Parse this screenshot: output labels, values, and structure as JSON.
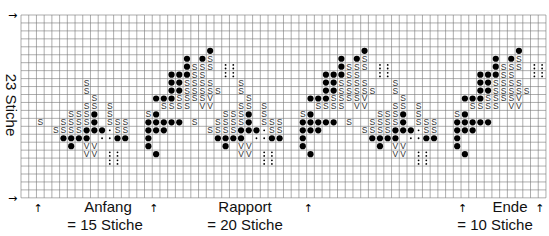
{
  "chart_data": {
    "type": "knitting-chart-grid",
    "rows": 23,
    "cols": 68,
    "repeat_width": 20,
    "y_label": "23 Stiche",
    "sections": [
      {
        "name": "Anfang",
        "label": "= 15 Stiche",
        "stitches": 15
      },
      {
        "name": "Rapport",
        "label": "= 20 Stiche",
        "stitches": 20
      },
      {
        "name": "Ende",
        "label": "= 10 Stiche",
        "stitches": 10
      }
    ],
    "symbols": {
      "dot": "●",
      "S": "S",
      "V": "V",
      "colon": ":"
    },
    "low_motif_anchors": [
      8,
      28,
      48
    ],
    "high_motif_anchors": [
      24,
      44,
      64
    ],
    "low_motif": [
      [
        8,
        0,
        "S"
      ],
      [
        9,
        0,
        "S"
      ],
      [
        10,
        1,
        "S"
      ],
      [
        11,
        0,
        "S"
      ],
      [
        11,
        1,
        "S"
      ],
      [
        11,
        3,
        "S"
      ],
      [
        12,
        -2,
        "S"
      ],
      [
        12,
        -1,
        "S"
      ],
      [
        12,
        0,
        "S"
      ],
      [
        12,
        1,
        "dot"
      ],
      [
        12,
        3,
        "S"
      ],
      [
        13,
        -6,
        "S"
      ],
      [
        13,
        -3,
        "S"
      ],
      [
        13,
        -2,
        "S"
      ],
      [
        13,
        -1,
        "S"
      ],
      [
        13,
        0,
        "S"
      ],
      [
        13,
        1,
        "dot"
      ],
      [
        13,
        3,
        "S"
      ],
      [
        13,
        4,
        "S"
      ],
      [
        13,
        5,
        "S"
      ],
      [
        14,
        -4,
        "S"
      ],
      [
        14,
        -3,
        "S"
      ],
      [
        14,
        -2,
        "S"
      ],
      [
        14,
        -1,
        "S"
      ],
      [
        14,
        0,
        "dot"
      ],
      [
        14,
        1,
        "dot"
      ],
      [
        14,
        2,
        "dot"
      ],
      [
        14,
        3,
        "sdot"
      ],
      [
        14,
        4,
        "S"
      ],
      [
        14,
        5,
        "S"
      ],
      [
        15,
        -3,
        "dot"
      ],
      [
        15,
        -2,
        "dot"
      ],
      [
        15,
        -1,
        "dot"
      ],
      [
        15,
        0,
        "dot"
      ],
      [
        15,
        2,
        "sdot"
      ],
      [
        15,
        3,
        "sdot"
      ],
      [
        15,
        4,
        "dot"
      ],
      [
        15,
        5,
        "dot"
      ],
      [
        16,
        -2,
        "dot"
      ],
      [
        16,
        0,
        "V"
      ],
      [
        16,
        1,
        "V"
      ],
      [
        17,
        0,
        "V"
      ],
      [
        17,
        1,
        "V"
      ],
      [
        17,
        3,
        "colon"
      ],
      [
        17,
        4,
        "colon"
      ],
      [
        18,
        3,
        "colon"
      ],
      [
        18,
        4,
        "colon"
      ]
    ],
    "high_motif": [
      [
        4,
        0,
        "dot"
      ],
      [
        5,
        -3,
        "dot"
      ],
      [
        5,
        -1,
        "dot"
      ],
      [
        5,
        0,
        "S"
      ],
      [
        6,
        -3,
        "dot"
      ],
      [
        6,
        -2,
        "S"
      ],
      [
        6,
        -1,
        "S"
      ],
      [
        6,
        0,
        "S"
      ],
      [
        6,
        2,
        "colon"
      ],
      [
        6,
        3,
        "colon"
      ],
      [
        7,
        -5,
        "dot"
      ],
      [
        7,
        -4,
        "dot"
      ],
      [
        7,
        -3,
        "dot"
      ],
      [
        7,
        -2,
        "S"
      ],
      [
        7,
        -1,
        "S"
      ],
      [
        7,
        2,
        "colon"
      ],
      [
        7,
        3,
        "colon"
      ],
      [
        8,
        -5,
        "dot"
      ],
      [
        8,
        -4,
        "dot"
      ],
      [
        8,
        -3,
        "S"
      ],
      [
        8,
        -2,
        "S"
      ],
      [
        8,
        -1,
        "S"
      ],
      [
        8,
        0,
        "S"
      ],
      [
        9,
        -5,
        "dot"
      ],
      [
        9,
        -4,
        "dot"
      ],
      [
        9,
        -3,
        "S"
      ],
      [
        9,
        -2,
        "S"
      ],
      [
        9,
        -1,
        "S"
      ],
      [
        9,
        0,
        "S"
      ],
      [
        9,
        1,
        "S"
      ],
      [
        10,
        -7,
        "dot"
      ],
      [
        10,
        -6,
        "dot"
      ],
      [
        10,
        -5,
        "dot"
      ],
      [
        10,
        -4,
        "S"
      ],
      [
        10,
        -3,
        "S"
      ],
      [
        10,
        -2,
        "S"
      ],
      [
        10,
        -1,
        "S"
      ],
      [
        10,
        0,
        "V"
      ],
      [
        11,
        -6,
        "S"
      ],
      [
        11,
        -5,
        "S"
      ],
      [
        11,
        -4,
        "S"
      ],
      [
        11,
        -3,
        "S"
      ],
      [
        11,
        -1,
        "V"
      ],
      [
        11,
        0,
        "V"
      ],
      [
        12,
        -8,
        "S"
      ],
      [
        12,
        -7,
        "dot"
      ],
      [
        13,
        -8,
        "dot"
      ],
      [
        13,
        -7,
        "dot"
      ],
      [
        13,
        -6,
        "dot"
      ],
      [
        13,
        -5,
        "dot"
      ],
      [
        13,
        -4,
        "dot"
      ],
      [
        14,
        -8,
        "dot"
      ],
      [
        14,
        -7,
        "dot"
      ],
      [
        14,
        -6,
        "dot"
      ],
      [
        15,
        -8,
        "dot"
      ],
      [
        16,
        -8,
        "dot"
      ],
      [
        17,
        -7,
        "dot"
      ]
    ],
    "markers_x_cols": [
      2,
      17,
      37,
      57,
      67
    ]
  },
  "labels": {
    "y_axis": "23 Stiche",
    "anfang_title": "Anfang",
    "anfang_count": "= 15 Stiche",
    "rapport_title": "Rapport",
    "rapport_count": "= 20 Stiche",
    "ende_title": "Ende",
    "ende_count": "= 10 Stiche"
  },
  "icons": {
    "arrow_up": "↑",
    "arrow_right": "→"
  }
}
